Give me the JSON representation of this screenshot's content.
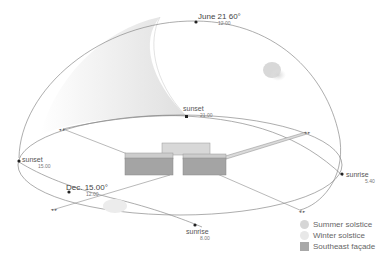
{
  "diagram": {
    "labels": {
      "june": {
        "title": "June 21 60°",
        "time": "12.00"
      },
      "sunset_summer": {
        "title": "sunset",
        "time": "21.00"
      },
      "sunset_winter": {
        "title": "sunset",
        "time": "15.00"
      },
      "dec": {
        "title": "Dec. 15.00°",
        "time": "12.00"
      },
      "sunrise_winter": {
        "title": "sunrise",
        "time": "8.00"
      },
      "sunrise_summer": {
        "title": "sunrise",
        "time": "5.40"
      }
    },
    "legend": [
      {
        "label": "Summer solstice",
        "color": "#d6d6d6",
        "shape": "circle"
      },
      {
        "label": "Winter solstice",
        "color": "#e8e8e8",
        "shape": "circle"
      },
      {
        "label": "Southeast façade",
        "color": "#a8a8a8",
        "shape": "square"
      }
    ],
    "colors": {
      "line": "#8a8a8a",
      "shade": "#e6e6e6",
      "building_front": "#a4a4a4",
      "building_top": "#d0d0d0",
      "dot": "#222222"
    }
  }
}
